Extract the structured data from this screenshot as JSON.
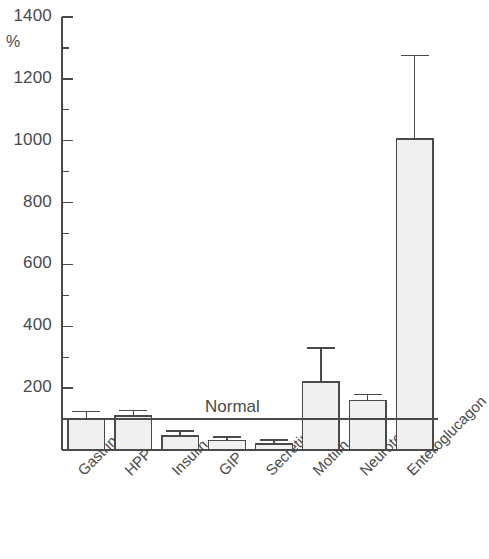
{
  "chart_data": {
    "type": "bar",
    "title": "",
    "subtitle": "",
    "xlabel": "",
    "ylabel": "%",
    "ylim": [
      0,
      1400
    ],
    "grid": false,
    "legend": null,
    "y_ticks_major": [
      0,
      200,
      400,
      600,
      800,
      1000,
      1200,
      1400
    ],
    "y_tick_labels": [
      "",
      "200",
      "400",
      "600",
      "800",
      "1000",
      "1200",
      "1400"
    ],
    "y_ticks_minor": [
      100,
      300,
      500,
      700,
      900,
      1100,
      1300
    ],
    "categories": [
      "Gastrin",
      "HPP",
      "Insulin",
      "GIP",
      "Secretin",
      "Motilin",
      "Neurotensin",
      "Enteroglucagon"
    ],
    "values": [
      100,
      110,
      45,
      30,
      20,
      220,
      160,
      1005
    ],
    "errors_upper": [
      125,
      128,
      62,
      42,
      33,
      330,
      180,
      1275
    ],
    "annotations": [
      {
        "label": "Normal",
        "type": "reference-line",
        "value": 100
      }
    ],
    "bar_fill": "#f0f0f0",
    "bar_stroke": "#4a4a4a",
    "axis_color": "#4a4a4a"
  },
  "axis": {
    "unit": "%"
  },
  "reference": {
    "normal_label": "Normal"
  }
}
